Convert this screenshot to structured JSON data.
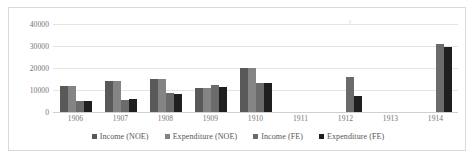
{
  "chart_data": {
    "type": "bar",
    "title": "",
    "subtitle": "",
    "xlabel": "",
    "ylabel": "",
    "ylim": [
      0,
      40000
    ],
    "yticks": [
      0,
      10000,
      20000,
      30000,
      40000
    ],
    "ytick_labels": [
      "0",
      "10000",
      "20000",
      "30000",
      "40000"
    ],
    "grid": true,
    "legend_position": "bottom",
    "categories": [
      "1906",
      "1907",
      "1908",
      "1909",
      "1910",
      "1911",
      "1912",
      "1913",
      "1914"
    ],
    "series": [
      {
        "name": "Income (NOE)",
        "color": "#595959",
        "values": [
          12000,
          14000,
          15000,
          10700,
          20000,
          null,
          null,
          null,
          null
        ]
      },
      {
        "name": "Expenditure (NOE)",
        "color": "#848484",
        "values": [
          12000,
          14000,
          15000,
          10700,
          20000,
          null,
          null,
          null,
          null
        ]
      },
      {
        "name": "Income (FE)",
        "color": "#6b6b6b",
        "values": [
          5000,
          5500,
          8500,
          12300,
          13200,
          null,
          16000,
          null,
          31000
        ]
      },
      {
        "name": "Expenditure (FE)",
        "color": "#1f1f1f",
        "values": [
          5000,
          5700,
          8200,
          11300,
          13200,
          null,
          7500,
          null,
          29500
        ]
      }
    ]
  },
  "colors": {
    "frame_border": "#d9d9d9",
    "gridline": "#e4e4e4",
    "axis_line": "#d0d0d0",
    "tick_text": "#737373",
    "legend_text": "#555555",
    "background": "#ffffff"
  }
}
